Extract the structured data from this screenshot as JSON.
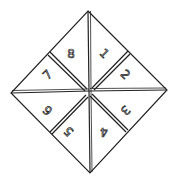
{
  "diagram": {
    "type": "paper fortune teller",
    "segments": [
      {
        "label": "1",
        "x": 104,
        "y": 54,
        "rot": 45
      },
      {
        "label": "2",
        "x": 125,
        "y": 75,
        "rot": 45
      },
      {
        "label": "3",
        "x": 125,
        "y": 110,
        "rot": 135
      },
      {
        "label": "4",
        "x": 104,
        "y": 131,
        "rot": 180
      },
      {
        "label": "5",
        "x": 69,
        "y": 131,
        "rot": 225
      },
      {
        "label": "6",
        "x": 48,
        "y": 110,
        "rot": 225
      },
      {
        "label": "7",
        "x": 48,
        "y": 75,
        "rot": -45
      },
      {
        "label": "8",
        "x": 71,
        "y": 54,
        "rot": 0
      }
    ],
    "stroke_color": "#222222",
    "background": "#ffffff"
  }
}
